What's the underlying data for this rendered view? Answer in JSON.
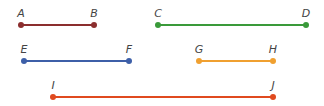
{
  "segments": [
    {
      "id": "AB",
      "color": "#8b2e2e",
      "p1": {
        "label": "A",
        "x": 21,
        "y": 25
      },
      "p2": {
        "label": "B",
        "x": 94,
        "y": 25
      }
    },
    {
      "id": "CD",
      "color": "#3a9a3a",
      "p1": {
        "label": "C",
        "x": 158,
        "y": 25
      },
      "p2": {
        "label": "D",
        "x": 306,
        "y": 25
      }
    },
    {
      "id": "EF",
      "color": "#3d5fa8",
      "p1": {
        "label": "E",
        "x": 24,
        "y": 61
      },
      "p2": {
        "label": "F",
        "x": 129,
        "y": 61
      }
    },
    {
      "id": "GH",
      "color": "#f0a030",
      "p1": {
        "label": "G",
        "x": 199,
        "y": 61
      },
      "p2": {
        "label": "H",
        "x": 273,
        "y": 61
      }
    },
    {
      "id": "IJ",
      "color": "#e04a1f",
      "p1": {
        "label": "I",
        "x": 53,
        "y": 97
      },
      "p2": {
        "label": "J",
        "x": 273,
        "y": 97
      }
    }
  ]
}
